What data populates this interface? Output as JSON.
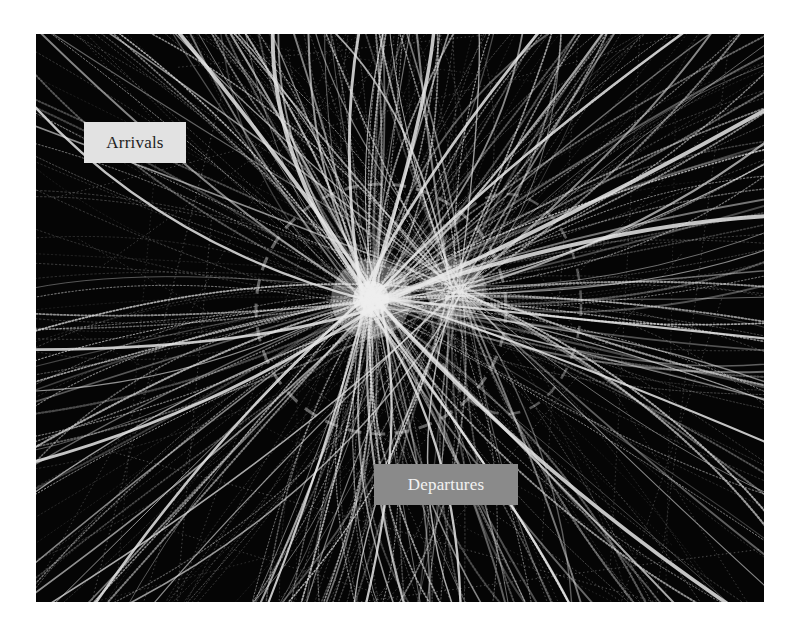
{
  "figure": {
    "background": "#050505",
    "track_color": "#e6e6e6",
    "ring_color": "#8c8c8c",
    "hub": {
      "x": 335,
      "y": 265
    },
    "hub2": {
      "x": 420,
      "y": 255
    },
    "ring": {
      "cx": 345,
      "cy": 275,
      "r": 125
    },
    "ring2": {
      "cx": 470,
      "cy": 270,
      "rx": 75,
      "ry": 110
    }
  },
  "labels": {
    "arrivals": {
      "text": "Arrivals",
      "x": 84,
      "y": 122,
      "w": 102,
      "h": 41,
      "bg": "#e2e2e2",
      "fg": "#1e1e1e"
    },
    "departures": {
      "text": "Departures",
      "x": 374,
      "y": 464,
      "w": 144,
      "h": 41,
      "bg": "#8a8a8a",
      "fg": "#f2f2f2"
    }
  }
}
